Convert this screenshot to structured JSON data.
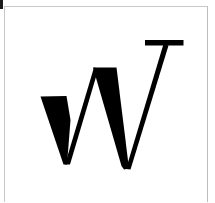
{
  "image": {
    "kind": "logotype-glyph",
    "width": 215,
    "height": 203,
    "background_color": "#ffffff",
    "ink_color": "#000000",
    "border_color": "#c9c9c9",
    "description": "Large black serif capital letter W on a white background inside a thin light-gray border box"
  },
  "frame": {
    "label": "page border",
    "left": 4,
    "top": 6,
    "width": 204,
    "height": 196
  },
  "artifact": {
    "label": "edge scan mark",
    "color": "#1b1b1b"
  },
  "glyph": {
    "character": "W",
    "alt_text": "W",
    "style": "high-contrast serif, thick downstrokes with hairline upstrokes",
    "fill": "#000000",
    "shapes": {
      "thick_stroke_one": "M 40 97 L 66 97 L 69 120 L 66 163 Z",
      "thick_stroke_one_alt": "M 40 97 L 66 96 L 67 164 L 63 164 Z",
      "thick_stroke_two": "M 93 68 L 116 68 L 128 168 L 122 168 Z",
      "hairline_one": "M 66 163 L 95 68 L 99 69 L 70 164 Z",
      "hairline_two": "M 127 168 L 164 45 L 168 46 L 131 169 Z",
      "serif_bar": "M 145 40 L 183 40 L 183 45 L 145 45 Z"
    },
    "vertices": {
      "left_top_left": [
        40,
        97
      ],
      "left_top_right": [
        66,
        96
      ],
      "left_bottom": [
        66,
        164
      ],
      "middle_peak_left": [
        93,
        68
      ],
      "middle_peak_right": [
        116,
        68
      ],
      "right_bottom": [
        127,
        168
      ],
      "serif_left": [
        145,
        40
      ],
      "serif_right": [
        183,
        40
      ],
      "hairline_top": [
        166,
        45
      ]
    }
  }
}
